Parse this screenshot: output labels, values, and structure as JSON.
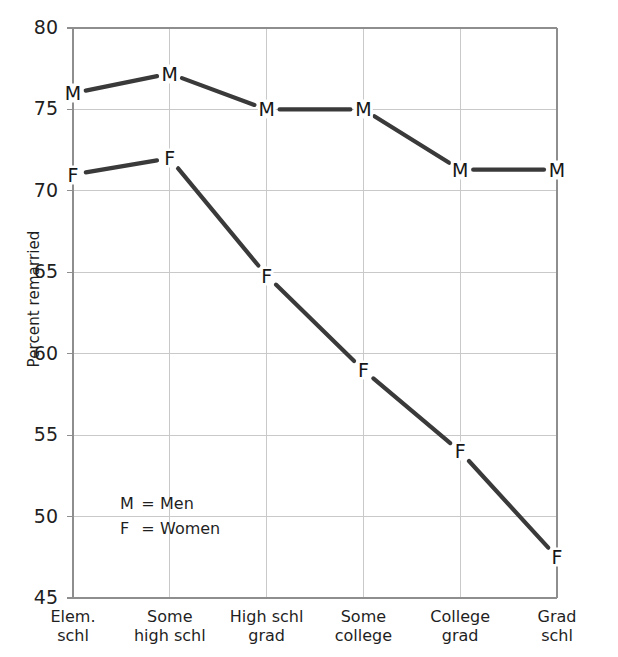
{
  "chart_data": {
    "type": "line",
    "title": "",
    "xlabel": "",
    "ylabel": "Percent remarried",
    "categories": [
      "Elem. schl",
      "Some high schl",
      "High schl grad",
      "Some college",
      "College grad",
      "Grad schl"
    ],
    "category_lines": [
      [
        "Elem.",
        "schl"
      ],
      [
        "Some",
        "high schl"
      ],
      [
        "High schl",
        "grad"
      ],
      [
        "Some",
        "college"
      ],
      [
        "College",
        "grad"
      ],
      [
        "Grad",
        "schl"
      ]
    ],
    "series": [
      {
        "name": "Men",
        "marker": "M",
        "values": [
          76.0,
          77.2,
          75.0,
          75.0,
          71.3,
          71.3
        ]
      },
      {
        "name": "Women",
        "marker": "F",
        "values": [
          71.0,
          72.0,
          64.8,
          59.0,
          54.0,
          47.5
        ]
      }
    ],
    "ylim": [
      45,
      80
    ],
    "yticks": [
      45,
      50,
      55,
      60,
      65,
      70,
      75,
      80
    ],
    "ytick_labels": [
      "45",
      "50",
      "55",
      "60",
      "65",
      "70",
      "75",
      "80"
    ],
    "grid": true,
    "legend_position": "inside-lower-left",
    "legend": [
      {
        "key": "M",
        "eq": "=",
        "label": "Men"
      },
      {
        "key": "F",
        "eq": "=",
        "label": "Women"
      }
    ],
    "colors": {
      "line": "#3a3a3a",
      "grid": "#c9c9c9",
      "axis": "#8e8e8e",
      "text": "#1f1f1f",
      "background": "#ffffff"
    }
  }
}
